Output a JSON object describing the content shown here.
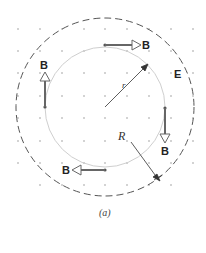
{
  "diagram": {
    "caption": "(a)",
    "field_label": "E",
    "inner_radius_label": "r",
    "outer_radius_label": "R",
    "vector_labels": {
      "top": "B",
      "left": "B",
      "right": "B",
      "bottom": "B"
    },
    "colors": {
      "outer_circle": "#555555",
      "inner_circle": "#cccccc",
      "dots": "#bbbbbb",
      "vectors": "#666666",
      "radius_lines": "#333333"
    }
  }
}
